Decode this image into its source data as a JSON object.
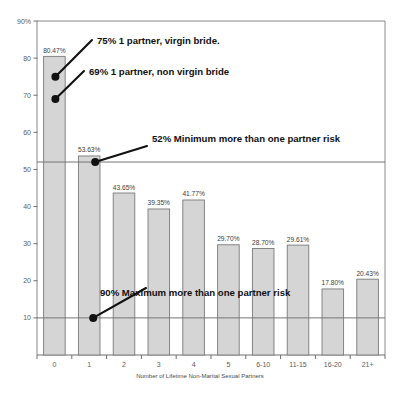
{
  "chart_data": {
    "type": "bar",
    "title": "",
    "xlabel": "Number of Lifetime Non-Marital Sexual Partners",
    "ylabel": "",
    "ylim": [
      0,
      90
    ],
    "grid": false,
    "legend": "none",
    "categories": [
      "0",
      "1",
      "2",
      "3",
      "4",
      "5",
      "6-10",
      "11-15",
      "16-20",
      "21+"
    ],
    "values": [
      80.47,
      53.63,
      43.65,
      39.35,
      41.77,
      29.7,
      28.7,
      29.61,
      17.8,
      20.43
    ],
    "value_labels": [
      "80.47%",
      "53.63%",
      "43.65%",
      "39.35%",
      "41.77%",
      "29.70%",
      "28.70%",
      "29.61%",
      "17.80%",
      "20.43%"
    ],
    "ytick_values": [
      90,
      80,
      70,
      60,
      50,
      40,
      30,
      20,
      10
    ],
    "ytick_labels": [
      "90%",
      "80",
      "70",
      "60",
      "50",
      "40",
      "30",
      "20",
      "10"
    ],
    "reference_lines": [
      {
        "name": "minimum-more-than-one-partner-risk",
        "value": 52,
        "label": "52% Minimum more than one partner risk"
      },
      {
        "name": "maximum-more-than-one-partner-risk",
        "value": 10,
        "label": "90% Maximum more than one partner risk"
      }
    ],
    "annotations": [
      {
        "name": "virgin-bride-marker",
        "label": "75% 1 partner, virgin bride.",
        "value": 75,
        "category": "0"
      },
      {
        "name": "non-virgin-bride-marker",
        "label": "69% 1 partner, non virgin bride",
        "value": 69,
        "category": "0"
      },
      {
        "name": "minimum-risk-marker",
        "label": "52% Minimum more than one partner risk",
        "value": 52,
        "category": "1"
      },
      {
        "name": "maximum-risk-marker",
        "label": "90% Maximum more than one partner risk",
        "value": 10,
        "category": "1"
      }
    ],
    "colors": {
      "bar_fill": "#d5d5d5",
      "bar_stroke": "#7a7a7a",
      "annotation": "#111111",
      "reference_line": "#757575",
      "axis": "#6e6e6e",
      "background": "#ffffff"
    }
  }
}
